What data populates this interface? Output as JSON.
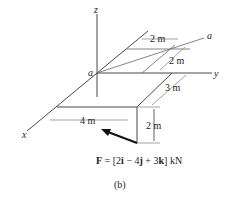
{
  "figure": {
    "axes": {
      "x": "x",
      "y": "y",
      "z": "z"
    },
    "origin_label": "a",
    "line_end_label": "a",
    "dimensions": {
      "top_width": "2 m",
      "top_depth": "2 m",
      "side_depth": "3 m",
      "front_width": "4 m",
      "height": "2 m"
    },
    "force": {
      "prefix": "F",
      "equals": " = [2",
      "i": "i",
      "m1": " − 4",
      "j": "j",
      "m2": " + 3",
      "k": "k",
      "unit": "] kN"
    },
    "caption": "(b)"
  }
}
